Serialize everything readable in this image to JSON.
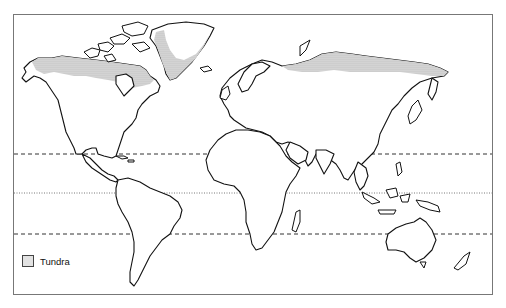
{
  "map": {
    "type": "world-outline",
    "frame": {
      "x": 13,
      "y": 14,
      "width": 480,
      "height": 281,
      "border_color": "#777777"
    },
    "latitude_lines": [
      {
        "name": "tropic-of-cancer",
        "y": 154,
        "style": "dashed"
      },
      {
        "name": "equator",
        "y": 193,
        "style": "dotted"
      },
      {
        "name": "tropic-of-capricorn",
        "y": 234,
        "style": "dashed"
      }
    ],
    "shaded_regions": [
      {
        "name": "north-america-tundra",
        "category": "Tundra"
      },
      {
        "name": "greenland-tundra",
        "category": "Tundra"
      },
      {
        "name": "eurasia-tundra",
        "category": "Tundra"
      }
    ],
    "colors": {
      "coastline": "#111111",
      "tundra_fill": "#d0d0d0",
      "background": "#ffffff"
    }
  },
  "legend": {
    "items": [
      {
        "label": "Tundra",
        "swatch": "stipple-gray"
      }
    ]
  }
}
